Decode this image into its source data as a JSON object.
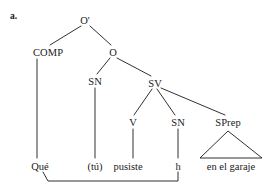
{
  "figure": {
    "item_tag": "a.",
    "language": "Spanish",
    "caption": "",
    "ink_color": "#1a1a1a",
    "background_color": "#ffffff"
  },
  "tree": {
    "nodes": [
      {
        "id": "Obar",
        "label": "O'",
        "x": 85,
        "y": 20
      },
      {
        "id": "COMP",
        "label": "COMP",
        "x": 48,
        "y": 52
      },
      {
        "id": "O",
        "label": "O",
        "x": 113,
        "y": 52
      },
      {
        "id": "SN1",
        "label": "SN",
        "x": 95,
        "y": 81
      },
      {
        "id": "SV",
        "label": "SV",
        "x": 155,
        "y": 83
      },
      {
        "id": "V",
        "label": "V",
        "x": 133,
        "y": 122
      },
      {
        "id": "SN2",
        "label": "SN",
        "x": 178,
        "y": 122
      },
      {
        "id": "SPrep",
        "label": "SPrep",
        "x": 228,
        "y": 122
      }
    ],
    "terminals": [
      {
        "id": "t-que",
        "label": "Qué",
        "x": 40,
        "y": 166,
        "parent": "COMP"
      },
      {
        "id": "t-tu",
        "label": "(tú)",
        "x": 95,
        "y": 166,
        "parent": "SN1"
      },
      {
        "id": "t-pusiste",
        "label": "pusiste",
        "x": 128,
        "y": 166,
        "parent": "V"
      },
      {
        "id": "t-h",
        "label": "h",
        "x": 178,
        "y": 166,
        "parent": "SN2"
      },
      {
        "id": "t-garaje",
        "label": "en el garaje",
        "x": 231,
        "y": 166,
        "parent": "SPrep"
      }
    ],
    "branches": [
      {
        "from": "Obar",
        "to": "COMP",
        "x1": 81,
        "y1": 26,
        "x2": 50,
        "y2": 45
      },
      {
        "from": "Obar",
        "to": "O",
        "x1": 90,
        "y1": 26,
        "x2": 111,
        "y2": 45
      },
      {
        "from": "O",
        "to": "SN1",
        "x1": 110,
        "y1": 58,
        "x2": 97,
        "y2": 74
      },
      {
        "from": "O",
        "to": "SV",
        "x1": 117,
        "y1": 58,
        "x2": 151,
        "y2": 76
      },
      {
        "from": "SV",
        "to": "V",
        "x1": 152,
        "y1": 89,
        "x2": 134,
        "y2": 115
      },
      {
        "from": "SV",
        "to": "SN2",
        "x1": 157,
        "y1": 89,
        "x2": 175,
        "y2": 115
      },
      {
        "from": "SV",
        "to": "SPrep",
        "x1": 161,
        "y1": 88,
        "x2": 225,
        "y2": 115
      },
      {
        "from": "COMP",
        "to": "t-que",
        "x1": 37,
        "y1": 59,
        "x2": 37,
        "y2": 158
      },
      {
        "from": "SN1",
        "to": "t-tu",
        "x1": 95,
        "y1": 88,
        "x2": 95,
        "y2": 158
      },
      {
        "from": "V",
        "to": "t-pusiste",
        "x1": 133,
        "y1": 129,
        "x2": 133,
        "y2": 158
      },
      {
        "from": "SN2",
        "to": "t-h",
        "x1": 178,
        "y1": 129,
        "x2": 178,
        "y2": 158
      }
    ],
    "triangle": {
      "parent": "SPrep",
      "apex_x": 228,
      "apex_y": 131,
      "left_x": 200,
      "left_y": 158,
      "right_x": 262,
      "right_y": 158
    },
    "movement_arc": {
      "from": "t-que",
      "to": "t-h",
      "path": "M 43 172 L 48 181 L 178 181 L 178 172",
      "description": "wh-movement line from Qué to trace h"
    }
  }
}
